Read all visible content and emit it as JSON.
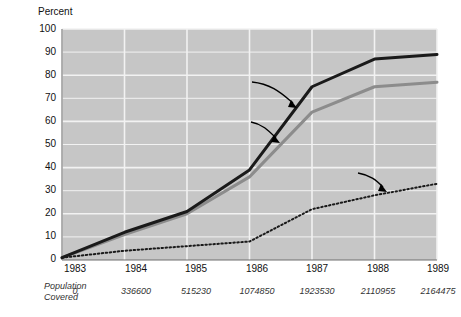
{
  "chart_data": {
    "type": "line",
    "title": "",
    "ylabel": "Percent",
    "xlabel": "",
    "ylim": [
      0,
      100
    ],
    "yticks": [
      0,
      10,
      20,
      30,
      40,
      50,
      60,
      70,
      80,
      90,
      100
    ],
    "categories": [
      "1983",
      "1984",
      "1985",
      "1986",
      "1987",
      "1988",
      "1989"
    ],
    "grid": true,
    "legend_position": "inline-annotations",
    "series": [
      {
        "name": "% Municipal Population covered",
        "style": "solid-thick-black",
        "color": "#1a1a1a",
        "values": [
          1,
          12,
          21,
          39,
          75,
          87,
          89
        ]
      },
      {
        "name": "% Total Population covered",
        "style": "solid-thick-gray",
        "color": "#8c8c8c",
        "values": [
          1,
          11,
          20,
          36,
          64,
          75,
          77
        ]
      },
      {
        "name": "% Municipalities covered",
        "style": "dotted-black",
        "color": "#1a1a1a",
        "values": [
          1,
          4,
          6,
          8,
          22,
          28,
          33
        ]
      }
    ],
    "annotations": [
      {
        "id": "municipal-population",
        "line1": "%  Municipal  Population",
        "line2": "covered"
      },
      {
        "id": "total-population",
        "line1": "%  Total  Population",
        "line2": "covered"
      },
      {
        "id": "municipalities",
        "line1": "%  Municipalities",
        "line2": "covered"
      }
    ],
    "footer_table": {
      "row_label_line1": "Population",
      "row_label_line2": "Covered",
      "values": [
        "0",
        "336600",
        "515230",
        "1074850",
        "1923530",
        "2110955",
        "2164475"
      ]
    },
    "plot_background": "#c6c6c6",
    "gridline_color": "#f2f2f2"
  }
}
